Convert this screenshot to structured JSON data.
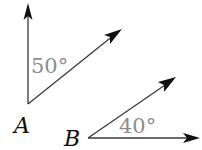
{
  "diagram": {
    "angles": [
      {
        "vertex_label": "A",
        "measure_label": "50°",
        "measure_deg": 50
      },
      {
        "vertex_label": "B",
        "measure_label": "40°",
        "measure_deg": 40
      }
    ],
    "colors": {
      "ray": "#3a3a3a",
      "arrowhead": "#111111",
      "measure_text": "#8c8c8c",
      "label_text": "#111111"
    }
  }
}
